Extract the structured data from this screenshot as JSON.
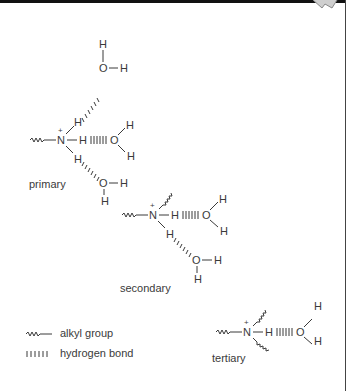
{
  "figure": {
    "colors": {
      "ink": "#3a3a3a",
      "frame": "#111111",
      "background": "#ffffff"
    }
  },
  "structures": {
    "primary": {
      "label": "primary",
      "nitrogen": "N",
      "charge": "+",
      "oxygen": "O",
      "hydrogen": "H"
    },
    "secondary": {
      "label": "secondary",
      "nitrogen": "N",
      "charge": "+",
      "oxygen": "O",
      "hydrogen": "H"
    },
    "tertiary": {
      "label": "tertiary",
      "nitrogen": "N",
      "charge": "+",
      "oxygen": "O",
      "hydrogen": "H"
    }
  },
  "legend": {
    "items": [
      {
        "symbol": "wavy-line",
        "label": "alkyl group"
      },
      {
        "symbol": "hash-line",
        "label": "hydrogen bond"
      }
    ]
  }
}
